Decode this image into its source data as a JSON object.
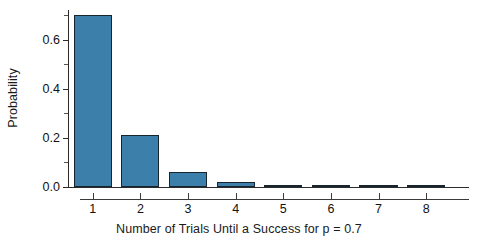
{
  "chart_data": {
    "type": "bar",
    "title": "",
    "xlabel": "Number of Trials Until a Success for p = 0.7",
    "ylabel": "Probability",
    "categories": [
      "1",
      "2",
      "3",
      "4",
      "5",
      "6",
      "7",
      "8"
    ],
    "values": [
      0.7,
      0.21,
      0.063,
      0.0189,
      0.00567,
      0.0017,
      0.00051,
      0.00015
    ],
    "xlim": [
      0.5,
      8.9
    ],
    "ylim": [
      0.0,
      0.72
    ],
    "ytick_labels": [
      "0.0",
      "0.2",
      "0.4",
      "0.6"
    ],
    "ytick_values": [
      0.0,
      0.2,
      0.4,
      0.6
    ],
    "ytick_minor_values": [
      0.1,
      0.3,
      0.5,
      0.7
    ],
    "grid": false,
    "legend": null,
    "bar_color": "#3c7fab",
    "bar_edge_color": "#17252e",
    "axis_color": "#2b2b2b",
    "background_color": "#ffffff"
  }
}
